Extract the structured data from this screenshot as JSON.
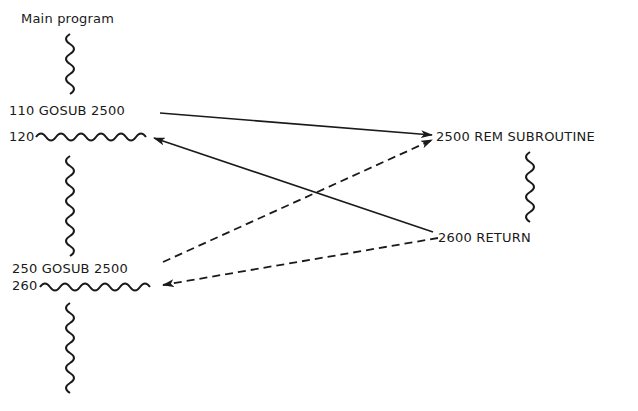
{
  "diagram": {
    "title": "Main program",
    "main_program": {
      "gosub_1": "110 GOSUB 2500",
      "return_line_1": "120",
      "gosub_2": "250 GOSUB 2500",
      "return_line_2": "260"
    },
    "subroutine": {
      "start": "2500 REM SUBROUTINE",
      "end": "2600 RETURN"
    },
    "arrows": [
      {
        "from": "110 GOSUB 2500",
        "to": "2500 REM SUBROUTINE",
        "style": "solid"
      },
      {
        "from": "2600 RETURN",
        "to": "120",
        "style": "solid"
      },
      {
        "from": "250 GOSUB 2500",
        "to": "2500 REM SUBROUTINE",
        "style": "dashed"
      },
      {
        "from": "2600 RETURN",
        "to": "260",
        "style": "dashed"
      }
    ],
    "colors": {
      "ink": "#1a1a1a",
      "background": "#ffffff"
    }
  }
}
